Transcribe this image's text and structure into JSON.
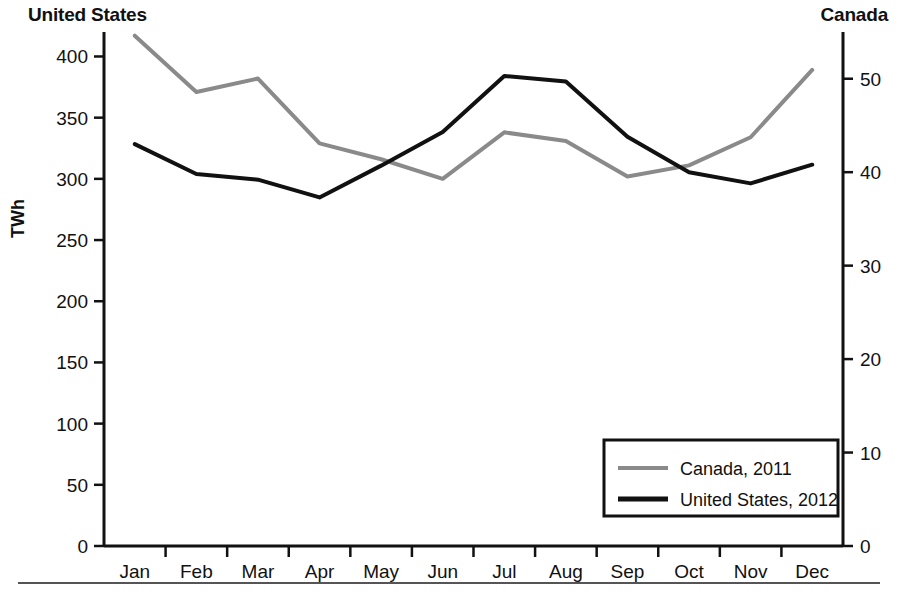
{
  "chart_data": {
    "type": "line",
    "title": "",
    "categories": [
      "Jan",
      "Feb",
      "Mar",
      "Apr",
      "May",
      "Jun",
      "Jul",
      "Aug",
      "Sep",
      "Oct",
      "Nov",
      "Dec"
    ],
    "xlabel": "",
    "grid": false,
    "legend_position": "bottom-right",
    "axes": {
      "left": {
        "title": "United States",
        "label": "TWh",
        "ylim": [
          0,
          420
        ],
        "ticks": [
          0,
          50,
          100,
          150,
          200,
          250,
          300,
          350,
          400
        ],
        "tick_labels": [
          "0",
          "50",
          "100",
          "150",
          "200",
          "250",
          "300",
          "350",
          "400"
        ]
      },
      "right": {
        "title": "Canada",
        "label": "",
        "ylim": [
          0,
          55
        ],
        "ticks": [
          0,
          10,
          20,
          30,
          40,
          50
        ],
        "tick_labels": [
          "0",
          "10",
          "20",
          "30",
          "40",
          "50"
        ]
      }
    },
    "series": [
      {
        "name": "Canada, 2011",
        "axis": "left",
        "color": "#8a8a8a",
        "values": [
          417,
          371,
          382,
          329,
          316,
          300,
          338,
          331,
          302,
          311,
          334,
          389
        ]
      },
      {
        "name": "United States, 2012",
        "axis": "right",
        "color": "#111111",
        "values": [
          43.0,
          39.8,
          39.2,
          37.3,
          40.7,
          44.3,
          50.3,
          49.7,
          43.8,
          40.0,
          38.8,
          40.8
        ]
      }
    ]
  },
  "legend": {
    "entries": [
      {
        "label": "Canada, 2011",
        "color": "#8a8a8a"
      },
      {
        "label": "United States, 2012",
        "color": "#111111"
      }
    ]
  }
}
